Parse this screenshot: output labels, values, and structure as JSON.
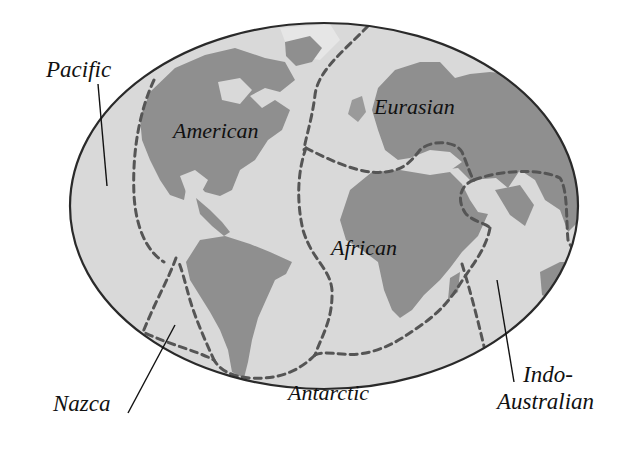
{
  "map": {
    "title": "Tectonic plates",
    "colors": {
      "background": "#ffffff",
      "ocean": "#d9d9d9",
      "land": "#8f8f8f",
      "land_light": "#bdbdbd",
      "outline": "#2a2a2a",
      "boundary": "#555555",
      "label": "#111111"
    },
    "plates": [
      {
        "id": "pacific",
        "label": "Pacific"
      },
      {
        "id": "american",
        "label": "American"
      },
      {
        "id": "eurasian",
        "label": "Eurasian"
      },
      {
        "id": "african",
        "label": "African"
      },
      {
        "id": "nazca",
        "label": "Nazca"
      },
      {
        "id": "antarctic",
        "label": "Antarctic"
      },
      {
        "id": "indo-australian",
        "label_line1": "Indo-",
        "label_line2": "Australian"
      }
    ]
  }
}
